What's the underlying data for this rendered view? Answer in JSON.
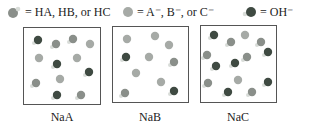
{
  "legend": [
    {
      "icon": "acid-molecule-icon",
      "text": "= HA, HB, or HC"
    },
    {
      "icon": "anion-sphere-icon",
      "text": "= A⁻, B⁻, or C⁻"
    },
    {
      "icon": "hydroxide-icon",
      "text": "= OH⁻"
    }
  ],
  "panels": [
    {
      "label": "NaA",
      "box": {
        "x": 23,
        "y": 27,
        "w": 78,
        "h": 78
      },
      "particles": [
        {
          "type": "OH",
          "x": 38,
          "y": 40
        },
        {
          "type": "HX",
          "x": 56,
          "y": 44
        },
        {
          "type": "HX",
          "x": 73,
          "y": 39
        },
        {
          "type": "X",
          "x": 90,
          "y": 44
        },
        {
          "type": "X",
          "x": 39,
          "y": 58
        },
        {
          "type": "OH",
          "x": 57,
          "y": 64
        },
        {
          "type": "X",
          "x": 77,
          "y": 58
        },
        {
          "type": "OH",
          "x": 89,
          "y": 72
        },
        {
          "type": "HX",
          "x": 36,
          "y": 83
        },
        {
          "type": "X",
          "x": 60,
          "y": 79
        },
        {
          "type": "OH",
          "x": 57,
          "y": 95
        },
        {
          "type": "HX",
          "x": 81,
          "y": 95
        }
      ]
    },
    {
      "label": "NaB",
      "box": {
        "x": 112,
        "y": 26,
        "w": 77,
        "h": 77
      },
      "particles": [
        {
          "type": "X",
          "x": 127,
          "y": 39
        },
        {
          "type": "X",
          "x": 155,
          "y": 36
        },
        {
          "type": "X",
          "x": 169,
          "y": 45
        },
        {
          "type": "OH",
          "x": 126,
          "y": 57
        },
        {
          "type": "X",
          "x": 149,
          "y": 57
        },
        {
          "type": "HX",
          "x": 174,
          "y": 62
        },
        {
          "type": "X",
          "x": 136,
          "y": 73
        },
        {
          "type": "X",
          "x": 161,
          "y": 82
        },
        {
          "type": "HX",
          "x": 125,
          "y": 93
        },
        {
          "type": "OH",
          "x": 174,
          "y": 91
        }
      ]
    },
    {
      "label": "NaC",
      "box": {
        "x": 200,
        "y": 25,
        "w": 77,
        "h": 78
      },
      "particles": [
        {
          "type": "OH",
          "x": 214,
          "y": 35
        },
        {
          "type": "HX",
          "x": 231,
          "y": 42
        },
        {
          "type": "X",
          "x": 245,
          "y": 35
        },
        {
          "type": "HX",
          "x": 261,
          "y": 42
        },
        {
          "type": "HX",
          "x": 207,
          "y": 55
        },
        {
          "type": "OH",
          "x": 268,
          "y": 52
        },
        {
          "type": "HX",
          "x": 247,
          "y": 57
        },
        {
          "type": "OH",
          "x": 216,
          "y": 66
        },
        {
          "type": "OH",
          "x": 235,
          "y": 63
        },
        {
          "type": "HX",
          "x": 208,
          "y": 83
        },
        {
          "type": "X",
          "x": 238,
          "y": 80
        },
        {
          "type": "OH",
          "x": 268,
          "y": 82
        },
        {
          "type": "OH",
          "x": 228,
          "y": 92
        },
        {
          "type": "HX",
          "x": 252,
          "y": 92
        }
      ]
    }
  ],
  "colors": {
    "hx": "#8a8f8a",
    "x": "#a6aaa6",
    "oh": "#3f4a42",
    "h": "#d8dcd8",
    "border": "#555555"
  }
}
